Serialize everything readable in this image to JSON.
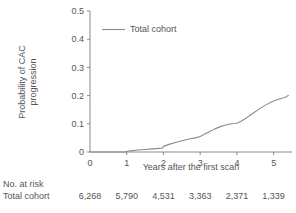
{
  "chart_data": {
    "type": "line",
    "title": "",
    "xlabel": "Years after the first scan",
    "ylabel_line1": "Probability of CAC",
    "ylabel_line2": "progression",
    "xlim": [
      0,
      5.5
    ],
    "ylim": [
      0,
      0.5
    ],
    "xticks": [
      0,
      1,
      2,
      3,
      4,
      5
    ],
    "xtick_labels": [
      "0",
      "1",
      "2",
      "3",
      "4",
      "5"
    ],
    "yticks": [
      0,
      0.1,
      0.2,
      0.3,
      0.4,
      0.5
    ],
    "ytick_labels": [
      "0",
      "0.1",
      "0.2",
      "0.3",
      "0.4",
      "0.5"
    ],
    "grid": false,
    "legend_position": "top-left-inside",
    "series": [
      {
        "name": "Total cohort",
        "color": "#8a8a8a",
        "x": [
          0,
          0.55,
          0.95,
          1.0,
          1.1,
          1.3,
          1.5,
          1.7,
          1.9,
          1.98,
          2.0,
          2.15,
          2.3,
          2.5,
          2.7,
          2.9,
          3.0,
          3.1,
          3.25,
          3.4,
          3.55,
          3.7,
          3.85,
          3.95,
          4.0,
          4.1,
          4.25,
          4.4,
          4.6,
          4.8,
          5.0,
          5.15,
          5.3,
          5.4
        ],
        "y": [
          0,
          0,
          0,
          0.002,
          0.004,
          0.007,
          0.009,
          0.011,
          0.013,
          0.014,
          0.02,
          0.027,
          0.033,
          0.04,
          0.046,
          0.051,
          0.055,
          0.062,
          0.072,
          0.082,
          0.09,
          0.096,
          0.1,
          0.101,
          0.102,
          0.108,
          0.12,
          0.134,
          0.152,
          0.168,
          0.181,
          0.188,
          0.193,
          0.2
        ]
      }
    ]
  },
  "legend": {
    "label": "Total cohort",
    "line_color": "#8a8a8a"
  },
  "risk_table": {
    "title": "No. at risk",
    "rows": [
      {
        "label": "Total cohort",
        "values": [
          "6,268",
          "5,790",
          "4,531",
          "3,363",
          "2,371",
          "1,339"
        ]
      }
    ]
  },
  "colors": {
    "axis": "#8a8a8a",
    "text": "#555555",
    "line": "#8a8a8a",
    "background": "#ffffff"
  }
}
